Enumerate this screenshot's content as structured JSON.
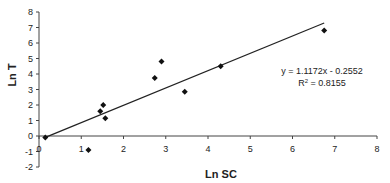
{
  "chart_data": {
    "type": "scatter",
    "title": "",
    "xlabel": "Ln SC",
    "ylabel": "Ln T",
    "xlim": [
      0,
      8
    ],
    "ylim": [
      -2,
      8
    ],
    "xticks": [
      0,
      1,
      2,
      3,
      4,
      5,
      6,
      7,
      8
    ],
    "yticks": [
      -2,
      -1,
      0,
      1,
      2,
      3,
      4,
      5,
      6,
      7,
      8
    ],
    "grid": false,
    "legend": null,
    "series": [
      {
        "name": "data",
        "marker": "diamond",
        "points": [
          {
            "x": 0.15,
            "y": -0.1
          },
          {
            "x": 1.17,
            "y": -0.9
          },
          {
            "x": 1.45,
            "y": 1.6
          },
          {
            "x": 1.52,
            "y": 2.0
          },
          {
            "x": 1.57,
            "y": 1.15
          },
          {
            "x": 2.74,
            "y": 3.75
          },
          {
            "x": 2.9,
            "y": 4.8
          },
          {
            "x": 3.45,
            "y": 2.85
          },
          {
            "x": 4.3,
            "y": 4.5
          },
          {
            "x": 6.75,
            "y": 6.8
          }
        ]
      }
    ],
    "trendline": {
      "type": "linear",
      "slope": 1.1172,
      "intercept": -0.2552,
      "x_range": [
        0.15,
        6.75
      ],
      "equation": "y = 1.1172x - 0.2552",
      "r_squared_label": "R",
      "r_squared_sup": "2",
      "r_squared_value": " = 0.8155"
    }
  }
}
